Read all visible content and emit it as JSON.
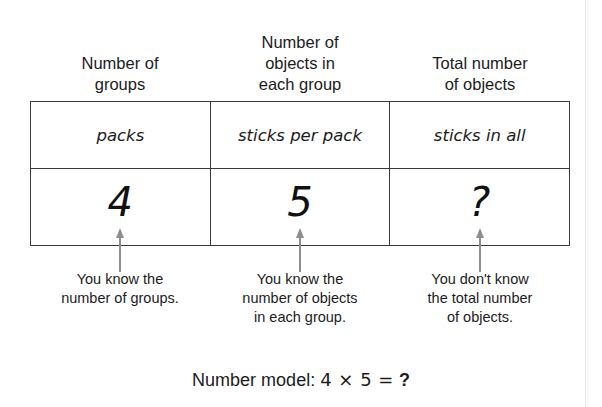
{
  "headers": [
    {
      "lines": [
        "Number of",
        "groups"
      ]
    },
    {
      "lines": [
        "Number of",
        "objects in",
        "each group"
      ]
    },
    {
      "lines": [
        "Total number",
        "of objects"
      ]
    }
  ],
  "table": {
    "unit_labels": [
      "packs",
      "sticks per pack",
      "sticks in all"
    ],
    "values": [
      "4",
      "5",
      "?"
    ]
  },
  "arrows": [
    {
      "name": "arrow-up-groups"
    },
    {
      "name": "arrow-up-objects-per-group"
    },
    {
      "name": "arrow-up-total"
    }
  ],
  "captions": [
    {
      "lines": [
        "You know the",
        "number of groups."
      ]
    },
    {
      "lines": [
        "You know the",
        "number of objects",
        "in each group."
      ]
    },
    {
      "lines": [
        "You don't know",
        "the total number",
        "of objects."
      ]
    }
  ],
  "number_model": {
    "label": "Number model:",
    "expression": "4 × 5 =",
    "answer": "?"
  },
  "colors": {
    "ink": "#1c1c1c",
    "rule": "#3a3a3a",
    "arrow": "#8e8e8e",
    "background": "#ffffff"
  }
}
